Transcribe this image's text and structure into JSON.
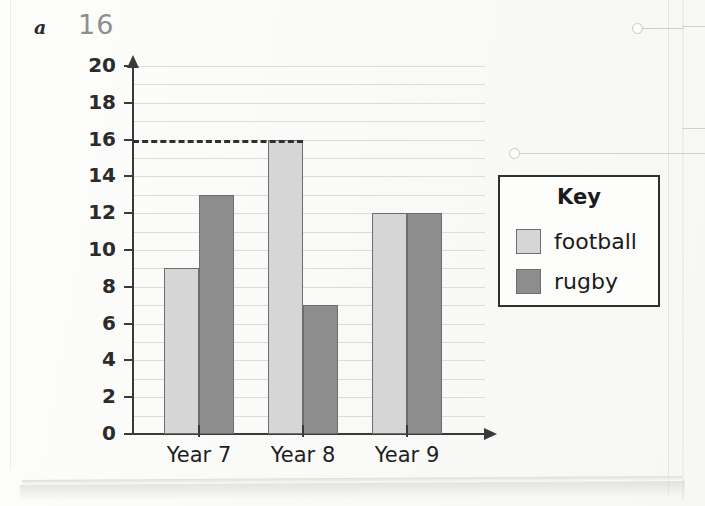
{
  "annotation": {
    "part_label": "a",
    "handwritten_answer": "16"
  },
  "legend": {
    "title": "Key",
    "entries": [
      {
        "label": "football",
        "color": "#d6d6d6"
      },
      {
        "label": "rugby",
        "color": "#8d8d8d"
      }
    ]
  },
  "colors": {
    "football": "#d6d6d6",
    "rugby": "#8d8d8d",
    "bar_outline": "#6e6e6e",
    "axis": "#3a3a3a",
    "gridline": "#dcdcda",
    "dashed_guide": "#2f2f2f"
  },
  "chart_data": {
    "type": "bar",
    "title": "",
    "xlabel": "",
    "ylabel": "",
    "categories": [
      "Year 7",
      "Year 8",
      "Year 9"
    ],
    "series": [
      {
        "name": "football",
        "values": [
          9,
          16,
          12
        ],
        "color": "#d6d6d6"
      },
      {
        "name": "rugby",
        "values": [
          13,
          7,
          12
        ],
        "color": "#8d8d8d"
      }
    ],
    "ylim": [
      0,
      20
    ],
    "ytick_step": 2,
    "ytick_labels": [
      "0",
      "2",
      "4",
      "6",
      "8",
      "10",
      "12",
      "14",
      "16",
      "18",
      "20"
    ],
    "gridlines": {
      "major_step": 2,
      "minor_step": 1,
      "visible": true
    },
    "annotations": [
      {
        "type": "dashed-guide",
        "value": 16,
        "orientation": "horizontal",
        "from": "y-axis",
        "to": "Year 8 football bar"
      }
    ],
    "legend_position": "right"
  }
}
